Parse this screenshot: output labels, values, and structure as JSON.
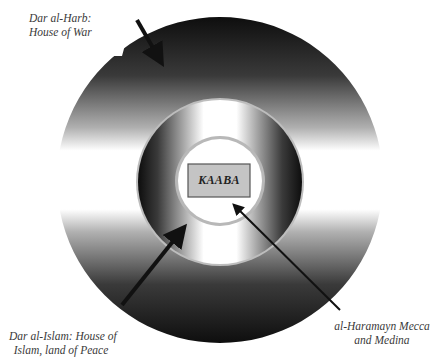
{
  "diagram": {
    "type": "concentric-circles",
    "center": "KAABA",
    "rings": [
      {
        "name": "outer",
        "label": "Dar al-Harb: House of War"
      },
      {
        "name": "middle",
        "label": "Dar al-Islam: House of Islam, land of Peace"
      },
      {
        "name": "inner",
        "label": "al-Haramayn Mecca and Medina"
      }
    ]
  },
  "labels": {
    "kaaba": "KAABA",
    "harb": {
      "line1": "Dar al-Harb:",
      "line2": "House of War"
    },
    "islam": {
      "line1": "Dar al-Islam: House of",
      "line2": "Islam, land of Peace"
    },
    "haramayn": {
      "line1": "al-Haramayn Mecca",
      "line2": "and Medina"
    }
  },
  "colors": {
    "dark": "#1a1a1a",
    "light": "#ffffff",
    "box_fill": "#c4c4c4",
    "box_stroke": "#555555",
    "ring_edge": "#aaaaaa",
    "arrow": "#111111"
  }
}
